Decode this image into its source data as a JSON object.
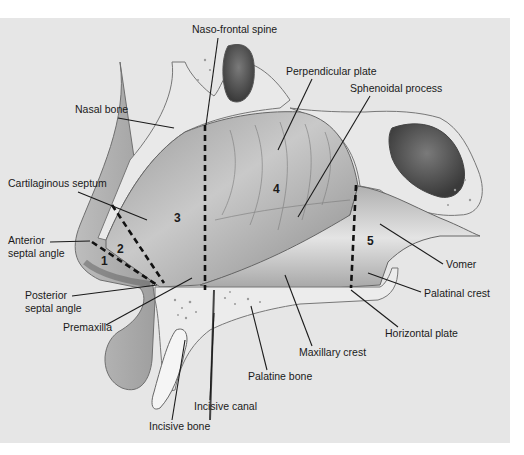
{
  "figure": {
    "background": "#e6e6e6",
    "panel": {
      "x": 0,
      "y": 18,
      "w": 510,
      "h": 425
    },
    "labels": [
      {
        "id": "naso-frontal-spine",
        "text": "Naso-frontal spine",
        "x": 192,
        "y": 33,
        "anchor": "start",
        "line": [
          [
            218,
            38
          ],
          [
            206,
            125
          ]
        ]
      },
      {
        "id": "perpendicular-plate",
        "text": "Perpendicular plate",
        "x": 286,
        "y": 75,
        "anchor": "start",
        "line": [
          [
            312,
            79
          ],
          [
            278,
            150
          ]
        ]
      },
      {
        "id": "sphenoidal-process",
        "text": "Sphenoidal process",
        "x": 350,
        "y": 92,
        "anchor": "start",
        "line": [
          [
            370,
            96
          ],
          [
            298,
            217
          ]
        ]
      },
      {
        "id": "nasal-bone",
        "text": "Nasal bone",
        "x": 75,
        "y": 113,
        "anchor": "start",
        "line": [
          [
            118,
            118
          ],
          [
            174,
            128
          ]
        ]
      },
      {
        "id": "cartilaginous-septum",
        "text": "Cartilaginous septum",
        "x": 8,
        "y": 187,
        "anchor": "start",
        "line": [
          [
            78,
            192
          ],
          [
            147,
            220
          ]
        ]
      },
      {
        "id": "anterior-septal-angle",
        "text": [
          "Anterior",
          "septal angle"
        ],
        "x": 8,
        "y": 244,
        "anchor": "start",
        "line": [
          [
            50,
            242
          ],
          [
            90,
            241
          ]
        ]
      },
      {
        "id": "posterior-septal-angle",
        "text": [
          "Posterior",
          "septal angle"
        ],
        "x": 25,
        "y": 299,
        "anchor": "start",
        "line": [
          [
            72,
            296
          ],
          [
            157,
            285
          ]
        ]
      },
      {
        "id": "premaxilla",
        "text": "Premaxilla",
        "x": 63,
        "y": 331,
        "anchor": "start",
        "line": [
          [
            106,
            325
          ],
          [
            192,
            278
          ]
        ]
      },
      {
        "id": "incisive-bone",
        "text": "Incisive bone",
        "x": 149,
        "y": 430,
        "anchor": "start",
        "line": [
          [
            172,
            420
          ],
          [
            185,
            340
          ]
        ]
      },
      {
        "id": "incisive-canal",
        "text": "Incisive canal",
        "x": 194,
        "y": 410,
        "anchor": "start",
        "line": [
          [
            210,
            400
          ],
          [
            214,
            313
          ]
        ]
      },
      {
        "id": "palatine-bone",
        "text": "Palatine bone",
        "x": 248,
        "y": 380,
        "anchor": "start",
        "line": [
          [
            267,
            370
          ],
          [
            251,
            306
          ]
        ]
      },
      {
        "id": "maxillary-crest",
        "text": "Maxillary crest",
        "x": 299,
        "y": 356,
        "anchor": "start",
        "line": [
          [
            312,
            346
          ],
          [
            285,
            275
          ]
        ]
      },
      {
        "id": "horizontal-plate",
        "text": "Horizontal plate",
        "x": 385,
        "y": 337,
        "anchor": "start",
        "line": [
          [
            398,
            327
          ],
          [
            351,
            290
          ]
        ]
      },
      {
        "id": "palatinal-crest",
        "text": "Palatinal crest",
        "x": 424,
        "y": 297,
        "anchor": "start",
        "line": [
          [
            421,
            292
          ],
          [
            368,
            273
          ]
        ]
      },
      {
        "id": "vomer",
        "text": "Vomer",
        "x": 446,
        "y": 268,
        "anchor": "start",
        "line": [
          [
            443,
            264
          ],
          [
            380,
            224
          ]
        ]
      }
    ],
    "regions": [
      {
        "id": "region-1",
        "text": "1",
        "x": 101,
        "y": 265
      },
      {
        "id": "region-2",
        "text": "2",
        "x": 117,
        "y": 253
      },
      {
        "id": "region-3",
        "text": "3",
        "x": 174,
        "y": 222
      },
      {
        "id": "region-4",
        "text": "4",
        "x": 273,
        "y": 193
      },
      {
        "id": "region-5",
        "text": "5",
        "x": 367,
        "y": 245
      }
    ],
    "dashed_lines": [
      [
        [
          205,
          125
        ],
        [
          205,
          290
        ]
      ],
      [
        [
          92,
          242
        ],
        [
          157,
          285
        ]
      ],
      [
        [
          112,
          205
        ],
        [
          164,
          283
        ]
      ],
      [
        [
          356,
          185
        ],
        [
          351,
          288
        ]
      ]
    ]
  }
}
